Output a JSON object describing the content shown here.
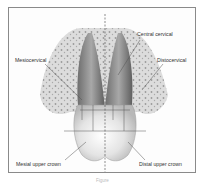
{
  "figure": {
    "labels": {
      "central_cervical": "Central cervical",
      "mesiocervical": "Mesiocervical",
      "distocervical": "Distocervical",
      "mesial_upper_crown": "Mesial upper crown",
      "distal_upper_crown": "Distal upper crown"
    },
    "caption": "Figure"
  },
  "colors": {
    "frame_border": "#8a8a8a",
    "bone": "#d9d9d9",
    "tooth_root": "#8c8c8c",
    "crown": "#e2e2e2",
    "leader_line": "#555555"
  }
}
